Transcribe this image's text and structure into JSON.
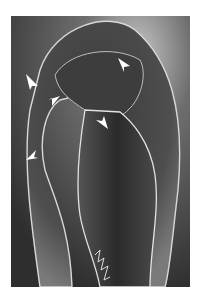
{
  "image": {
    "description": "Grayscale scanning electron micrograph of a curved embryo/larval structure with white arrows indicating features",
    "arrows": [
      {
        "id": 1,
        "x": 31,
        "y": 80,
        "direction": "down-right"
      },
      {
        "id": 2,
        "x": 57,
        "y": 102,
        "direction": "down-left"
      },
      {
        "id": 3,
        "x": 124,
        "y": 62,
        "direction": "down-right"
      },
      {
        "id": 4,
        "x": 101,
        "y": 121,
        "direction": "up-left"
      },
      {
        "id": 5,
        "x": 30,
        "y": 157,
        "direction": "up-left"
      }
    ],
    "colors": {
      "background": "#ffffff",
      "dark": "#2a2a2a",
      "mid": "#6a6a6a",
      "edge": "#e0e0e0"
    }
  }
}
